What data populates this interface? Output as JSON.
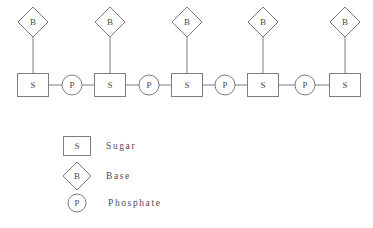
{
  "canvas": {
    "width": 373,
    "height": 228,
    "background": "#ffffff",
    "stroke_color": "#7c7c82",
    "text_color": "#4a4a50"
  },
  "chain": {
    "sugar_label": "S",
    "base_label": "B",
    "phosphate_label": "P",
    "unit_count": 5,
    "phosphate_count": 4,
    "sugars": [
      {
        "label": "S",
        "cx": 33,
        "cy": 85
      },
      {
        "label": "S",
        "cx": 110,
        "cy": 85
      },
      {
        "label": "S",
        "cx": 187,
        "cy": 85
      },
      {
        "label": "S",
        "cx": 263,
        "cy": 85
      },
      {
        "label": "S",
        "cx": 345,
        "cy": 85
      }
    ],
    "bases": [
      {
        "label": "B",
        "cx": 33,
        "cy": 22
      },
      {
        "label": "B",
        "cx": 110,
        "cy": 22
      },
      {
        "label": "B",
        "cx": 187,
        "cy": 22
      },
      {
        "label": "B",
        "cx": 263,
        "cy": 22
      },
      {
        "label": "B",
        "cx": 345,
        "cy": 22
      }
    ],
    "phosphates": [
      {
        "label": "P",
        "cx": 72,
        "cy": 85
      },
      {
        "label": "P",
        "cx": 149,
        "cy": 85
      },
      {
        "label": "P",
        "cx": 225,
        "cy": 85
      },
      {
        "label": "P",
        "cx": 305,
        "cy": 85
      }
    ],
    "geometry": {
      "sugar_box_width": 31,
      "sugar_box_height": 23,
      "base_diamond_radius": 15,
      "phosphate_radius": 10
    }
  },
  "legend": {
    "items": [
      {
        "key": "sugar",
        "symbol": "S",
        "shape": "square",
        "label": "Sugar",
        "cx": 77,
        "cy": 146,
        "text_x": 106
      },
      {
        "key": "base",
        "symbol": "B",
        "shape": "diamond",
        "label": "Base",
        "cx": 77,
        "cy": 176,
        "text_x": 106
      },
      {
        "key": "phosphate",
        "symbol": "P",
        "shape": "circle",
        "label": "Phosphate",
        "cx": 77,
        "cy": 203,
        "text_x": 108
      }
    ],
    "geometry": {
      "square_width": 27,
      "square_height": 19,
      "diamond_radius": 14,
      "circle_radius": 9
    }
  }
}
